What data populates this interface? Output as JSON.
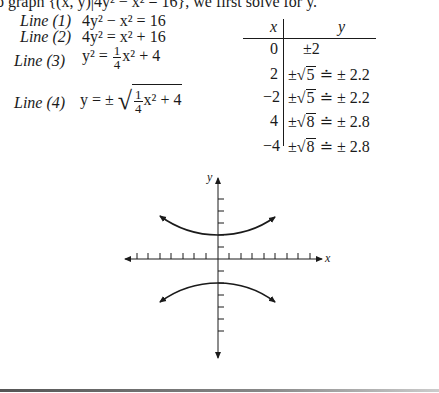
{
  "intro_text": "o graph {(x, y)|4y² − x² = 16}, we first solve for y.",
  "derivation": [
    {
      "label": "Line (1)",
      "lhs": "4y² − x² = 16"
    },
    {
      "label": "Line (2)",
      "lhs": "4y² = x² + 16"
    },
    {
      "label": "Line (3)",
      "lhs_prefix": "y² = ",
      "frac_num": "1",
      "frac_den": "4",
      "rhs_suffix": "x² + 4"
    },
    {
      "label": "Line (4)",
      "lhs_prefix": "y = ±",
      "frac_num": "1",
      "frac_den": "4",
      "rhs_suffix": "x² + 4"
    }
  ],
  "table": {
    "headers": [
      "x",
      "y"
    ],
    "rows": [
      {
        "x": "0",
        "y": "±2"
      },
      {
        "x": "2",
        "y_pm": "±",
        "y_rad": "5",
        "y_approx": "≐ ± 2.2"
      },
      {
        "x": "−2",
        "y_pm": "±",
        "y_rad": "5",
        "y_approx": "≐ ± 2.2"
      },
      {
        "x": "4",
        "y_pm": "±",
        "y_rad": "8",
        "y_approx": "≐ ± 2.8"
      },
      {
        "x": "−4",
        "y_pm": "±",
        "y_rad": "8",
        "y_approx": "≐ ± 2.8"
      }
    ]
  },
  "graph": {
    "x_axis_label": "x",
    "y_axis_label": "y",
    "equation": "4y² − x² = 16",
    "type": "hyperbola",
    "vertices": [
      [
        0,
        2
      ],
      [
        0,
        -2
      ]
    ]
  }
}
